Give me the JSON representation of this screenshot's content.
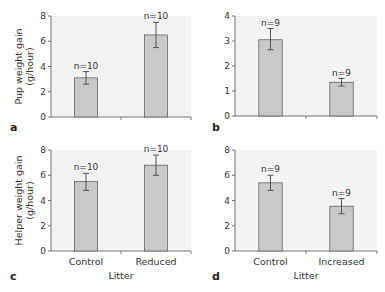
{
  "figure": {
    "colors": {
      "plot_bg": "#f3f3f3",
      "bar_fill": "#c9c9c9",
      "bar_stroke": "#555555",
      "axis": "#555555",
      "error_bar": "#444444"
    }
  },
  "chart_data": [
    {
      "panel": "a",
      "type": "bar",
      "title": "",
      "ylabel": "Pup weight gain (g/hour)",
      "ylabel_lines": [
        "Pup weight gain",
        "(g/hour)"
      ],
      "xlabel": "",
      "categories": [
        "Control",
        "Reduced"
      ],
      "show_categories": false,
      "values": [
        3.1,
        6.5
      ],
      "error_low": [
        2.6,
        5.5
      ],
      "error_high": [
        3.6,
        7.5
      ],
      "n_labels": [
        "n=10",
        "n=10"
      ],
      "ylim": [
        0,
        8
      ],
      "yticks": [
        0,
        2,
        4,
        6,
        8
      ],
      "grid": false
    },
    {
      "panel": "b",
      "type": "bar",
      "title": "",
      "ylabel": "",
      "ylabel_lines": [],
      "xlabel": "",
      "categories": [
        "Control",
        "Increased"
      ],
      "show_categories": false,
      "values": [
        3.05,
        1.35
      ],
      "error_low": [
        2.65,
        1.2
      ],
      "error_high": [
        3.5,
        1.5
      ],
      "n_labels": [
        "n=9",
        "n=9"
      ],
      "ylim": [
        0,
        4
      ],
      "yticks": [
        0,
        1,
        2,
        3,
        4
      ],
      "grid": false
    },
    {
      "panel": "c",
      "type": "bar",
      "title": "",
      "ylabel": "Helper weight gain (g/hour)",
      "ylabel_lines": [
        "Helper weight gain",
        "(g/hour)"
      ],
      "xlabel": "Litter",
      "categories": [
        "Control",
        "Reduced"
      ],
      "show_categories": true,
      "values": [
        5.5,
        6.8
      ],
      "error_low": [
        4.8,
        6.0
      ],
      "error_high": [
        6.15,
        7.6
      ],
      "n_labels": [
        "n=10",
        "n=10"
      ],
      "ylim": [
        0,
        8
      ],
      "yticks": [
        0,
        2,
        4,
        6,
        8
      ],
      "grid": false
    },
    {
      "panel": "d",
      "type": "bar",
      "title": "",
      "ylabel": "",
      "ylabel_lines": [],
      "xlabel": "Litter",
      "categories": [
        "Control",
        "Increased"
      ],
      "show_categories": true,
      "values": [
        5.4,
        3.55
      ],
      "error_low": [
        4.8,
        2.95
      ],
      "error_high": [
        6.0,
        4.15
      ],
      "n_labels": [
        "n=9",
        "n=9"
      ],
      "ylim": [
        0,
        8
      ],
      "yticks": [
        0,
        2,
        4,
        6,
        8
      ],
      "grid": false
    }
  ]
}
